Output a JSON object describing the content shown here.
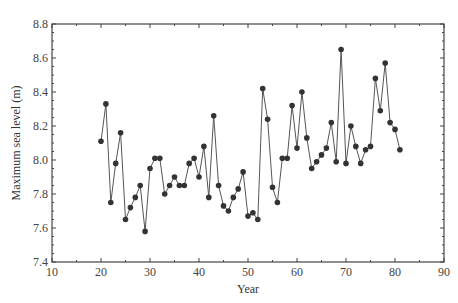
{
  "chart_data": {
    "type": "line",
    "title": "",
    "xlabel": "Year",
    "ylabel": "Maximum sea level (m)",
    "xlim": [
      10,
      90
    ],
    "ylim": [
      7.4,
      8.8
    ],
    "xticks": [
      10,
      20,
      30,
      40,
      50,
      60,
      70,
      80,
      90
    ],
    "yticks": [
      7.4,
      7.6,
      7.8,
      8.0,
      8.2,
      8.4,
      8.6,
      8.8
    ],
    "ytick_labels": [
      "7.4",
      "7.6",
      "7.8",
      "8.0",
      "8.2",
      "8.4",
      "8.6",
      "8.8"
    ],
    "grid": false,
    "legend": null,
    "markers": true,
    "series": [
      {
        "name": "Maximum sea level",
        "x": [
          20,
          21,
          22,
          23,
          24,
          25,
          26,
          27,
          28,
          29,
          30,
          31,
          32,
          33,
          34,
          35,
          36,
          37,
          38,
          39,
          40,
          41,
          42,
          43,
          44,
          45,
          46,
          47,
          48,
          49,
          50,
          51,
          52,
          53,
          54,
          55,
          56,
          57,
          58,
          59,
          60,
          61,
          62,
          63,
          64,
          65,
          66,
          67,
          68,
          69,
          70,
          71,
          72,
          73,
          74,
          75,
          76,
          77,
          78,
          79,
          80,
          81
        ],
        "values": [
          8.11,
          8.33,
          7.75,
          7.98,
          8.16,
          7.65,
          7.72,
          7.78,
          7.85,
          7.58,
          7.95,
          8.01,
          8.01,
          7.8,
          7.85,
          7.9,
          7.85,
          7.85,
          7.98,
          8.01,
          7.9,
          8.08,
          7.78,
          8.26,
          7.85,
          7.73,
          7.7,
          7.78,
          7.83,
          7.93,
          7.67,
          7.69,
          7.65,
          8.42,
          8.24,
          7.84,
          7.75,
          8.01,
          8.01,
          8.32,
          8.07,
          8.4,
          8.13,
          7.95,
          7.99,
          8.03,
          8.07,
          8.22,
          7.99,
          8.65,
          7.98,
          8.2,
          8.08,
          7.98,
          8.06,
          8.08,
          8.48,
          8.29,
          8.57,
          8.22,
          8.18,
          8.06
        ]
      }
    ]
  },
  "colors": {
    "line": "#555555",
    "marker": "#333333",
    "axis": "#444444"
  }
}
